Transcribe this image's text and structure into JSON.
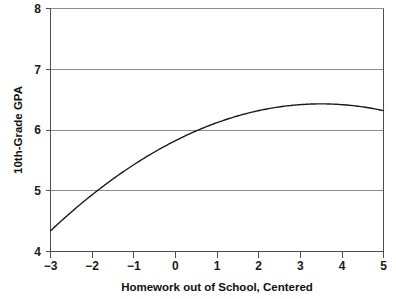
{
  "chart_data": {
    "type": "line",
    "title": "",
    "xlabel": "Homework out of School, Centered",
    "ylabel": "10th-Grade GPA",
    "xlim": [
      -3,
      5
    ],
    "ylim": [
      4,
      8
    ],
    "xticks": [
      -3,
      -2,
      -1,
      0,
      1,
      2,
      3,
      4,
      5
    ],
    "xticklabels": [
      "−3",
      "−2",
      "−1",
      "0",
      "1",
      "2",
      "3",
      "4",
      "5"
    ],
    "yticks": [
      4,
      5,
      6,
      7,
      8
    ],
    "yticklabels": [
      "4",
      "5",
      "6",
      "7",
      "8"
    ],
    "grid": "horizontal",
    "legend": "none",
    "series": [
      {
        "name": "Predicted 10th-Grade GPA",
        "curve_type": "quadratic",
        "equation": "y = 6.43 - 0.0533 * (x - 3.5)^2",
        "x": [
          -3,
          -2.5,
          -2,
          -1.5,
          -1,
          -0.5,
          0,
          0.5,
          1,
          1.5,
          2,
          2.5,
          3,
          3.5,
          4,
          4.5,
          5
        ],
        "values": [
          4.34,
          4.51,
          4.68,
          4.83,
          4.97,
          5.11,
          5.23,
          5.35,
          5.46,
          5.56,
          5.65,
          5.74,
          5.81,
          5.88,
          5.93,
          5.98,
          6.02
        ]
      }
    ],
    "points": [
      {
        "x": -3,
        "y": 4.34,
        "note": "left endpoint"
      },
      {
        "x": -1.9,
        "y": 5.0,
        "note": "crosses GPA 5"
      },
      {
        "x": 0,
        "y": 5.72,
        "note": "center"
      },
      {
        "x": 0.6,
        "y": 6.0,
        "note": "crosses GPA 6"
      },
      {
        "x": 3.5,
        "y": 6.43,
        "note": "peak / vertex"
      },
      {
        "x": 5,
        "y": 6.31,
        "note": "right endpoint"
      }
    ]
  },
  "axes": {
    "y_title": "10th-Grade GPA",
    "x_title": "Homework out of School, Centered"
  },
  "colors": {
    "curve": "#1a1a1a",
    "gridline": "#8c8c8c",
    "axis": "#4d4d4d",
    "background": "#ffffff",
    "text": "#111111"
  }
}
